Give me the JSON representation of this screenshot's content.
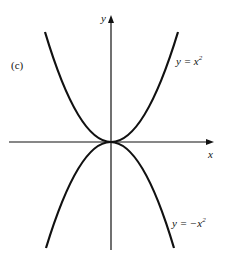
{
  "figure": {
    "panel_label": "(c)",
    "x_axis_label": "x",
    "y_axis_label": "y",
    "curves": [
      {
        "name": "upper-parabola",
        "equation_lhs": "y = x",
        "exponent": "2",
        "full": "y = x^2"
      },
      {
        "name": "lower-parabola",
        "equation_lhs": "y = −x",
        "exponent": "2",
        "full": "y = -x^2"
      }
    ],
    "colors": {
      "stroke": "#111111",
      "background": "#ffffff"
    }
  }
}
